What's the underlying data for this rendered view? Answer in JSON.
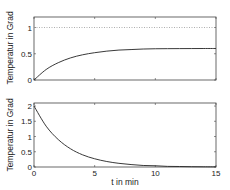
{
  "chart_data": [
    {
      "type": "line",
      "title": "",
      "xlabel": "",
      "ylabel": "Temperatur in Grad",
      "xlim": [
        0,
        15
      ],
      "ylim": [
        0,
        1.2
      ],
      "xticks": [
        0,
        5,
        10,
        15
      ],
      "xtick_labels_visible": false,
      "yticks": [
        0,
        0.5,
        1
      ],
      "ytick_labels": [
        "0",
        "0.5",
        "1"
      ],
      "grid": false,
      "series": [
        {
          "name": "temperature",
          "style": "solid",
          "color": "#222222",
          "x": [
            0,
            1,
            2,
            3,
            4,
            5,
            6,
            7,
            8,
            9,
            10,
            11,
            12,
            13,
            14,
            15
          ],
          "y": [
            0,
            0.2,
            0.33,
            0.42,
            0.48,
            0.52,
            0.55,
            0.57,
            0.58,
            0.59,
            0.595,
            0.597,
            0.598,
            0.599,
            0.6,
            0.6
          ]
        },
        {
          "name": "reference",
          "style": "dotted",
          "color": "#999999",
          "x": [
            0,
            15
          ],
          "y": [
            1,
            1
          ]
        }
      ]
    },
    {
      "type": "line",
      "title": "",
      "xlabel": "t in min",
      "ylabel": "Temperatur in Grad",
      "xlim": [
        0,
        15
      ],
      "ylim": [
        0,
        2.1
      ],
      "xticks": [
        0,
        5,
        10,
        15
      ],
      "xtick_labels": [
        "0",
        "5",
        "10",
        "15"
      ],
      "yticks": [
        0,
        0.5,
        1,
        1.5,
        2
      ],
      "ytick_labels": [
        "0",
        "0.5",
        "1",
        "1.5",
        "2"
      ],
      "grid": false,
      "series": [
        {
          "name": "temperature-difference",
          "style": "solid",
          "color": "#222222",
          "x": [
            0,
            1,
            2,
            3,
            4,
            5,
            6,
            7,
            8,
            9,
            10,
            11,
            12,
            13,
            14,
            15
          ],
          "y": [
            2,
            1.34,
            0.9,
            0.6,
            0.4,
            0.27,
            0.18,
            0.12,
            0.08,
            0.05,
            0.04,
            0.02,
            0.016,
            0.01,
            0.007,
            0.005
          ]
        }
      ]
    }
  ],
  "labels": {
    "top_ylabel": "Temperatur in Grad",
    "bottom_ylabel": "Temperatur in Grad",
    "bottom_xlabel": "t in min"
  }
}
